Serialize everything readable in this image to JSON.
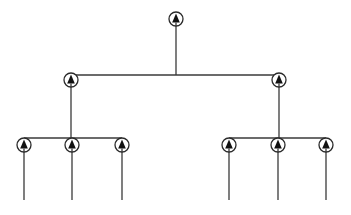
{
  "diagram": {
    "type": "tree",
    "colors": {
      "background": "#ffffff",
      "line": "#3a3a3a",
      "node_ring": "#2a2a2a",
      "arrow": "#111111"
    },
    "node_icon": "circled-up-arrow-icon",
    "node_radius": 7,
    "nodes": [
      {
        "id": "root",
        "level": 0,
        "x": 176,
        "y": 19
      },
      {
        "id": "mid-left",
        "level": 1,
        "x": 71,
        "y": 80,
        "parent": "root"
      },
      {
        "id": "mid-right",
        "level": 1,
        "x": 279,
        "y": 80,
        "parent": "root"
      },
      {
        "id": "leaf-1",
        "level": 2,
        "x": 24,
        "y": 145,
        "parent": "mid-left"
      },
      {
        "id": "leaf-2",
        "level": 2,
        "x": 72,
        "y": 145,
        "parent": "mid-left"
      },
      {
        "id": "leaf-3",
        "level": 2,
        "x": 122,
        "y": 145,
        "parent": "mid-left"
      },
      {
        "id": "leaf-4",
        "level": 2,
        "x": 229,
        "y": 145,
        "parent": "mid-right"
      },
      {
        "id": "leaf-5",
        "level": 2,
        "x": 278,
        "y": 145,
        "parent": "mid-right"
      },
      {
        "id": "leaf-6",
        "level": 2,
        "x": 326,
        "y": 145,
        "parent": "mid-right"
      }
    ],
    "bars": [
      {
        "id": "bar-level-1",
        "x1": 71,
        "x2": 279,
        "y": 75
      },
      {
        "id": "bar-left-leaves",
        "x1": 24,
        "x2": 122,
        "y": 138
      },
      {
        "id": "bar-right-leaves",
        "x1": 229,
        "x2": 326,
        "y": 138
      }
    ],
    "leaf_line_bottom": 200
  }
}
